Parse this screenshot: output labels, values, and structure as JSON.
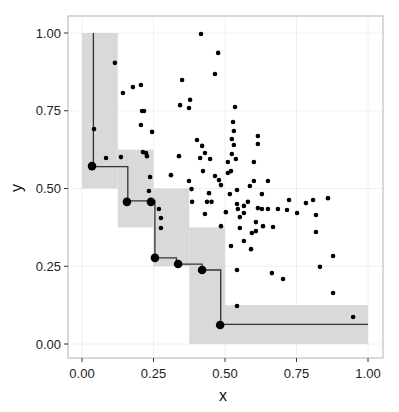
{
  "chart_data": {
    "type": "scatter",
    "title": "",
    "xlabel": "x",
    "ylabel": "y",
    "xlim": [
      -0.05,
      1.05
    ],
    "ylim": [
      -0.045,
      1.055
    ],
    "grid": true,
    "legend": "none",
    "x_ticks": [
      "0.00",
      "0.25",
      "0.50",
      "0.75",
      "1.00"
    ],
    "y_ticks": [
      "0.00",
      "0.25",
      "0.50",
      "0.75",
      "1.00"
    ],
    "x_tick_values": [
      0,
      0.25,
      0.5,
      0.75,
      1.0
    ],
    "y_tick_values": [
      0,
      0.25,
      0.5,
      0.75,
      1.0
    ],
    "colors": {
      "panel_border": "#b3b3b3",
      "grid": "#ececec",
      "band": "#d9d9d9",
      "points": "#000000",
      "step_line": "#333333"
    },
    "shaded_regions": [
      {
        "x0": 0.0,
        "x1": 0.125,
        "y0": 0.5,
        "y1": 1.0
      },
      {
        "x0": 0.125,
        "x1": 0.25,
        "y0": 0.375,
        "y1": 0.625
      },
      {
        "x0": 0.25,
        "x1": 0.375,
        "y0": 0.25,
        "y1": 0.5
      },
      {
        "x0": 0.375,
        "x1": 0.5,
        "y0": 0.0,
        "y1": 0.375
      },
      {
        "x0": 0.5,
        "x1": 1.0,
        "y0": 0.0,
        "y1": 0.125
      }
    ],
    "step_line": [
      [
        0.04,
        1.0
      ],
      [
        0.04,
        0.57
      ],
      [
        0.16,
        0.57
      ],
      [
        0.16,
        0.46
      ],
      [
        0.255,
        0.46
      ],
      [
        0.255,
        0.277
      ],
      [
        0.33,
        0.277
      ],
      [
        0.33,
        0.257
      ],
      [
        0.42,
        0.257
      ],
      [
        0.42,
        0.238
      ],
      [
        0.485,
        0.238
      ],
      [
        0.485,
        0.063
      ],
      [
        1.0,
        0.063
      ]
    ],
    "frontier_points": [
      {
        "x": 0.035,
        "y": 0.572
      },
      {
        "x": 0.157,
        "y": 0.457
      },
      {
        "x": 0.241,
        "y": 0.457
      },
      {
        "x": 0.255,
        "y": 0.277
      },
      {
        "x": 0.336,
        "y": 0.257
      },
      {
        "x": 0.42,
        "y": 0.238
      },
      {
        "x": 0.483,
        "y": 0.061
      }
    ],
    "points": [
      {
        "x": 0.042,
        "y": 0.691
      },
      {
        "x": 0.084,
        "y": 0.598
      },
      {
        "x": 0.136,
        "y": 0.601
      },
      {
        "x": 0.115,
        "y": 0.904
      },
      {
        "x": 0.143,
        "y": 0.807
      },
      {
        "x": 0.178,
        "y": 0.826
      },
      {
        "x": 0.206,
        "y": 0.833
      },
      {
        "x": 0.21,
        "y": 0.749
      },
      {
        "x": 0.217,
        "y": 0.749
      },
      {
        "x": 0.206,
        "y": 0.704
      },
      {
        "x": 0.245,
        "y": 0.682
      },
      {
        "x": 0.213,
        "y": 0.617
      },
      {
        "x": 0.224,
        "y": 0.614
      },
      {
        "x": 0.227,
        "y": 0.604
      },
      {
        "x": 0.238,
        "y": 0.537
      },
      {
        "x": 0.234,
        "y": 0.492
      },
      {
        "x": 0.269,
        "y": 0.434
      },
      {
        "x": 0.276,
        "y": 0.405
      },
      {
        "x": 0.276,
        "y": 0.373
      },
      {
        "x": 0.311,
        "y": 0.543
      },
      {
        "x": 0.339,
        "y": 0.604
      },
      {
        "x": 0.343,
        "y": 0.768
      },
      {
        "x": 0.35,
        "y": 0.849
      },
      {
        "x": 0.374,
        "y": 0.759
      },
      {
        "x": 0.378,
        "y": 0.785
      },
      {
        "x": 0.374,
        "y": 0.524
      },
      {
        "x": 0.383,
        "y": 0.498
      },
      {
        "x": 0.385,
        "y": 0.457
      },
      {
        "x": 0.402,
        "y": 0.656
      },
      {
        "x": 0.42,
        "y": 0.637
      },
      {
        "x": 0.43,
        "y": 0.614
      },
      {
        "x": 0.413,
        "y": 0.598
      },
      {
        "x": 0.448,
        "y": 0.595
      },
      {
        "x": 0.423,
        "y": 0.556
      },
      {
        "x": 0.444,
        "y": 0.485
      },
      {
        "x": 0.437,
        "y": 0.457
      },
      {
        "x": 0.453,
        "y": 0.457
      },
      {
        "x": 0.465,
        "y": 0.54
      },
      {
        "x": 0.479,
        "y": 0.527
      },
      {
        "x": 0.486,
        "y": 0.511
      },
      {
        "x": 0.416,
        "y": 0.997
      },
      {
        "x": 0.465,
        "y": 0.868
      },
      {
        "x": 0.476,
        "y": 0.936
      },
      {
        "x": 0.43,
        "y": 0.418
      },
      {
        "x": 0.486,
        "y": 0.379
      },
      {
        "x": 0.503,
        "y": 0.424
      },
      {
        "x": 0.517,
        "y": 0.482
      },
      {
        "x": 0.521,
        "y": 0.315
      },
      {
        "x": 0.521,
        "y": 0.556
      },
      {
        "x": 0.528,
        "y": 0.714
      },
      {
        "x": 0.535,
        "y": 0.762
      },
      {
        "x": 0.531,
        "y": 0.685
      },
      {
        "x": 0.524,
        "y": 0.659
      },
      {
        "x": 0.531,
        "y": 0.64
      },
      {
        "x": 0.538,
        "y": 0.595
      },
      {
        "x": 0.524,
        "y": 0.611
      },
      {
        "x": 0.51,
        "y": 0.585
      },
      {
        "x": 0.51,
        "y": 0.55
      },
      {
        "x": 0.542,
        "y": 0.495
      },
      {
        "x": 0.542,
        "y": 0.45
      },
      {
        "x": 0.545,
        "y": 0.434
      },
      {
        "x": 0.552,
        "y": 0.408
      },
      {
        "x": 0.552,
        "y": 0.373
      },
      {
        "x": 0.566,
        "y": 0.444
      },
      {
        "x": 0.566,
        "y": 0.421
      },
      {
        "x": 0.566,
        "y": 0.331
      },
      {
        "x": 0.58,
        "y": 0.457
      },
      {
        "x": 0.587,
        "y": 0.508
      },
      {
        "x": 0.594,
        "y": 0.357
      },
      {
        "x": 0.591,
        "y": 0.305
      },
      {
        "x": 0.601,
        "y": 0.524
      },
      {
        "x": 0.601,
        "y": 0.585
      },
      {
        "x": 0.608,
        "y": 0.392
      },
      {
        "x": 0.608,
        "y": 0.363
      },
      {
        "x": 0.615,
        "y": 0.643
      },
      {
        "x": 0.615,
        "y": 0.669
      },
      {
        "x": 0.615,
        "y": 0.437
      },
      {
        "x": 0.629,
        "y": 0.482
      },
      {
        "x": 0.629,
        "y": 0.434
      },
      {
        "x": 0.633,
        "y": 0.379
      },
      {
        "x": 0.65,
        "y": 0.524
      },
      {
        "x": 0.65,
        "y": 0.434
      },
      {
        "x": 0.668,
        "y": 0.376
      },
      {
        "x": 0.685,
        "y": 0.434
      },
      {
        "x": 0.703,
        "y": 0.209
      },
      {
        "x": 0.717,
        "y": 0.431
      },
      {
        "x": 0.724,
        "y": 0.463
      },
      {
        "x": 0.752,
        "y": 0.421
      },
      {
        "x": 0.664,
        "y": 0.228
      },
      {
        "x": 0.542,
        "y": 0.238
      },
      {
        "x": 0.542,
        "y": 0.122
      },
      {
        "x": 0.783,
        "y": 0.453
      },
      {
        "x": 0.808,
        "y": 0.463
      },
      {
        "x": 0.818,
        "y": 0.415
      },
      {
        "x": 0.818,
        "y": 0.36
      },
      {
        "x": 0.832,
        "y": 0.248
      },
      {
        "x": 0.86,
        "y": 0.469
      },
      {
        "x": 0.878,
        "y": 0.283
      },
      {
        "x": 0.878,
        "y": 0.164
      },
      {
        "x": 0.948,
        "y": 0.087
      }
    ]
  }
}
